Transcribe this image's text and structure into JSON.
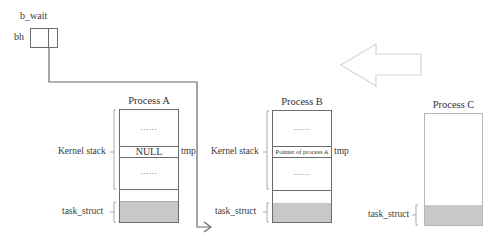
{
  "pointer": {
    "label": "b_wait",
    "owner_label": "bh"
  },
  "transition_arrow": {
    "direction": "left",
    "color": "#d6d6d6"
  },
  "processes": [
    {
      "title": "Process A",
      "kernel_stack_label": "Kernel stack",
      "task_struct_label": "task_struct",
      "upper_dots": "......",
      "tmp_cell": "NULL",
      "tmp_label": "tmp",
      "lower_dots": "......"
    },
    {
      "title": "Process B",
      "kernel_stack_label": "Kernel stack",
      "task_struct_label": "task_struct",
      "upper_dots": "......",
      "tmp_cell": "Pointer of process A",
      "tmp_label": "tmp",
      "lower_dots": "......"
    },
    {
      "title": "Process C",
      "task_struct_label": "task_struct"
    }
  ],
  "colors": {
    "box_border": "#6b6b6b",
    "task_struct_fill": "#c8c8c8",
    "bracket": "#9a9a9a",
    "line": "#6b6b6b",
    "faded_border": "#b5b5b5"
  }
}
